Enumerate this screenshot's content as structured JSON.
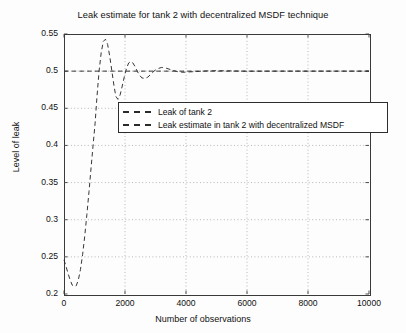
{
  "chart_data": {
    "type": "line",
    "title": "Leak estimate for tank 2 with decentralized MSDF technique",
    "xlabel": "Number of observations",
    "ylabel": "Level of leak",
    "xlim": [
      0,
      10000
    ],
    "ylim": [
      0.2,
      0.55
    ],
    "xticks": [
      0,
      2000,
      4000,
      6000,
      8000,
      10000
    ],
    "xtick_labels": [
      "0",
      "2000",
      "4000",
      "6000",
      "8000",
      "10000"
    ],
    "yticks": [
      0.2,
      0.25,
      0.3,
      0.35,
      0.4,
      0.45,
      0.5,
      0.55
    ],
    "ytick_labels": [
      "0.2",
      "0.25",
      "0.3",
      "0.35",
      "0.4",
      "0.45",
      "0.5",
      "0.55"
    ],
    "grid": true,
    "grid_style": "dotted",
    "legend_position": "upper-center",
    "series": [
      {
        "name": "Leak of tank 2",
        "style": "dashed",
        "color": "#2b2b2b",
        "x": [
          0,
          10000
        ],
        "y": [
          0.5,
          0.5
        ]
      },
      {
        "name": "Leak estimate in tank 2 with decentralized MSDF",
        "style": "dashed",
        "color": "#2b2b2b",
        "x": [
          0,
          60,
          130,
          200,
          270,
          330,
          400,
          470,
          540,
          610,
          680,
          750,
          820,
          890,
          960,
          1020,
          1080,
          1150,
          1220,
          1290,
          1360,
          1430,
          1500,
          1570,
          1640,
          1700,
          1770,
          1840,
          1910,
          1980,
          2050,
          2120,
          2190,
          2260,
          2330,
          2400,
          2470,
          2550,
          2650,
          2750,
          2850,
          2950,
          3050,
          3200,
          3350,
          3500,
          3700,
          3900,
          4200,
          4600,
          5000,
          5500,
          6000,
          7000,
          8000,
          9000,
          10000
        ],
        "y": [
          0.246,
          0.238,
          0.228,
          0.219,
          0.212,
          0.21,
          0.211,
          0.219,
          0.233,
          0.253,
          0.278,
          0.307,
          0.338,
          0.371,
          0.403,
          0.43,
          0.465,
          0.5,
          0.525,
          0.54,
          0.543,
          0.536,
          0.52,
          0.5,
          0.48,
          0.466,
          0.462,
          0.468,
          0.48,
          0.493,
          0.504,
          0.511,
          0.513,
          0.511,
          0.506,
          0.5,
          0.495,
          0.491,
          0.49,
          0.492,
          0.496,
          0.5,
          0.503,
          0.505,
          0.504,
          0.502,
          0.4995,
          0.4985,
          0.4992,
          0.5002,
          0.5006,
          0.5003,
          0.4999,
          0.5,
          0.5,
          0.5,
          0.5
        ]
      }
    ]
  },
  "legend": {
    "items": [
      {
        "label": "Leak of tank 2"
      },
      {
        "label": "Leak estimate in tank 2 with decentralized MSDF"
      }
    ]
  }
}
